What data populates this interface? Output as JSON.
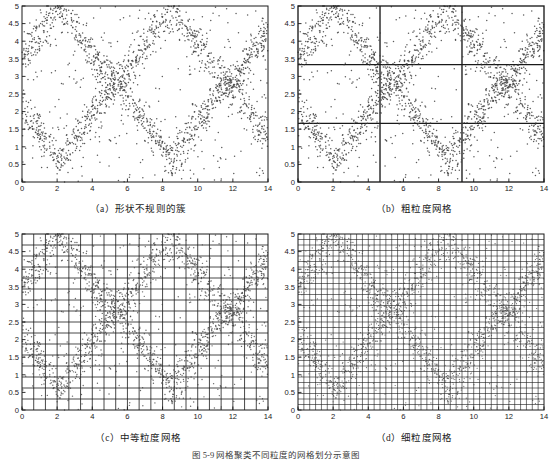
{
  "figure": {
    "footer_caption": "图 5-9  网格聚类不同粒度的网格划分示意图",
    "background_color": "#ffffff",
    "axis_color": "#1a1a1a",
    "grid_color": "#1a1a1a",
    "point_color": "#404040"
  },
  "panels": [
    {
      "id": "a",
      "caption": "（a）形状不规则的簇",
      "grid_cols": 0,
      "grid_rows": 0,
      "grid_line_width": 0,
      "point_size": 0.75,
      "point_opacity": 0.85
    },
    {
      "id": "b",
      "caption": "（b）粗粒度网格",
      "grid_cols": 3,
      "grid_rows": 3,
      "grid_line_width": 1.35,
      "point_size": 0.75,
      "point_opacity": 0.85,
      "grid_x_lines": [
        4.667,
        9.333
      ],
      "grid_y_lines": [
        1.667,
        3.333
      ]
    },
    {
      "id": "c",
      "caption": "（c）中等粒度网格",
      "grid_cols": 21,
      "grid_rows": 16,
      "grid_line_width": 0.8,
      "point_size": 0.7,
      "point_opacity": 0.8
    },
    {
      "id": "d",
      "caption": "（d）细粒度网格",
      "grid_cols": 42,
      "grid_rows": 32,
      "grid_line_width": 0.6,
      "point_size": 0.6,
      "point_opacity": 0.8
    }
  ],
  "chart_data": {
    "type": "scatter",
    "title": "",
    "xlabel": "",
    "ylabel": "",
    "xlim": [
      0,
      14
    ],
    "ylim": [
      0,
      5
    ],
    "grid": "varies by panel",
    "legend": "none",
    "x_ticks": [
      0,
      2,
      4,
      6,
      8,
      10,
      12,
      14
    ],
    "x_tick_labels": [
      "0",
      "2",
      "4",
      "6",
      "8",
      "10",
      "12",
      "14"
    ],
    "y_ticks": [
      0,
      0.5,
      1,
      1.5,
      2,
      2.5,
      3,
      3.5,
      4,
      4.5,
      5
    ],
    "y_tick_labels": [
      "0",
      "0.5",
      "1",
      "1.5",
      "2",
      "2.5",
      "3",
      "3.5",
      "4",
      "4.5",
      "5"
    ],
    "series": [
      {
        "name": "cluster-band-upper",
        "description": "Dense zig-zag band of points, triangular wave, upper branch",
        "n_points": 900,
        "wave": {
          "amplitude": 1.15,
          "offset": 3.85,
          "period": 6.4,
          "phase": 1.05,
          "spread": 0.27
        }
      },
      {
        "name": "cluster-band-lower",
        "description": "Dense zig-zag band of points, triangular wave, lower branch",
        "n_points": 900,
        "wave": {
          "amplitude": 1.15,
          "offset": 1.75,
          "period": 6.4,
          "phase": 4.25,
          "spread": 0.27
        }
      },
      {
        "name": "background-noise",
        "description": "Sparse uniformly distributed noise points",
        "n_points": 320
      }
    ],
    "total_points": 2120,
    "marker": "dot",
    "marker_color": "#404040"
  }
}
